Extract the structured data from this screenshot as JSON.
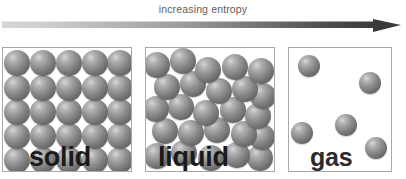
{
  "header": {
    "caption": "increasing entropy",
    "arrow": {
      "name": "gradient-arrow",
      "direction": "right",
      "gradient_start_color": "#cfcfcf",
      "gradient_end_color": "#3a3a3a"
    }
  },
  "colors": {
    "background": "#ffffff",
    "panel_border": "#a8a8a8",
    "caption_text": "#5d5d5d",
    "label_text": "#1a1a1a",
    "sphere_light": "#d8d8d8",
    "sphere_mid": "#8f8f8f",
    "sphere_dark": "#5a5a5a"
  },
  "panels": [
    {
      "id": "solid",
      "label": "solid",
      "particle_count": 25,
      "arrangement": "regular 5x5 close-packed lattice",
      "spheres": [
        {
          "x": 1,
          "y": 2,
          "d": 26
        },
        {
          "x": 27,
          "y": 2,
          "d": 26
        },
        {
          "x": 53,
          "y": 2,
          "d": 26
        },
        {
          "x": 79,
          "y": 2,
          "d": 26
        },
        {
          "x": 104,
          "y": 2,
          "d": 26
        },
        {
          "x": 1,
          "y": 27,
          "d": 26
        },
        {
          "x": 27,
          "y": 27,
          "d": 26
        },
        {
          "x": 53,
          "y": 27,
          "d": 26
        },
        {
          "x": 79,
          "y": 27,
          "d": 26
        },
        {
          "x": 104,
          "y": 27,
          "d": 26
        },
        {
          "x": 1,
          "y": 51,
          "d": 26
        },
        {
          "x": 27,
          "y": 51,
          "d": 26
        },
        {
          "x": 53,
          "y": 51,
          "d": 26
        },
        {
          "x": 79,
          "y": 51,
          "d": 26
        },
        {
          "x": 104,
          "y": 51,
          "d": 26
        },
        {
          "x": 1,
          "y": 75,
          "d": 26
        },
        {
          "x": 27,
          "y": 75,
          "d": 26
        },
        {
          "x": 53,
          "y": 75,
          "d": 26
        },
        {
          "x": 79,
          "y": 75,
          "d": 26
        },
        {
          "x": 104,
          "y": 75,
          "d": 26
        },
        {
          "x": 1,
          "y": 99,
          "d": 26
        },
        {
          "x": 27,
          "y": 99,
          "d": 26
        },
        {
          "x": 53,
          "y": 99,
          "d": 26
        },
        {
          "x": 79,
          "y": 99,
          "d": 26
        },
        {
          "x": 104,
          "y": 99,
          "d": 26
        }
      ]
    },
    {
      "id": "liquid",
      "label": "liquid",
      "particle_count": 24,
      "arrangement": "irregular jittered close packing",
      "spheres": [
        {
          "x": -2,
          "y": 4,
          "d": 26
        },
        {
          "x": 24,
          "y": 0,
          "d": 26
        },
        {
          "x": 49,
          "y": 9,
          "d": 26
        },
        {
          "x": 76,
          "y": 6,
          "d": 26
        },
        {
          "x": 102,
          "y": 10,
          "d": 26
        },
        {
          "x": 8,
          "y": 26,
          "d": 26
        },
        {
          "x": 34,
          "y": 23,
          "d": 26
        },
        {
          "x": 60,
          "y": 30,
          "d": 26
        },
        {
          "x": 86,
          "y": 28,
          "d": 26
        },
        {
          "x": 104,
          "y": 35,
          "d": 26
        },
        {
          "x": -3,
          "y": 48,
          "d": 26
        },
        {
          "x": 22,
          "y": 46,
          "d": 26
        },
        {
          "x": 47,
          "y": 52,
          "d": 26
        },
        {
          "x": 74,
          "y": 49,
          "d": 26
        },
        {
          "x": 99,
          "y": 55,
          "d": 26
        },
        {
          "x": 6,
          "y": 70,
          "d": 26
        },
        {
          "x": 32,
          "y": 72,
          "d": 26
        },
        {
          "x": 58,
          "y": 69,
          "d": 26
        },
        {
          "x": 85,
          "y": 73,
          "d": 26
        },
        {
          "x": 103,
          "y": 76,
          "d": 26
        },
        {
          "x": -2,
          "y": 95,
          "d": 26
        },
        {
          "x": 25,
          "y": 92,
          "d": 26
        },
        {
          "x": 52,
          "y": 97,
          "d": 26
        },
        {
          "x": 78,
          "y": 94,
          "d": 26
        },
        {
          "x": 101,
          "y": 97,
          "d": 26
        }
      ]
    },
    {
      "id": "gas",
      "label": "gas",
      "particle_count": 5,
      "arrangement": "widely separated randomly scattered",
      "spheres": [
        {
          "x": 9,
          "y": 7,
          "d": 22
        },
        {
          "x": 70,
          "y": 24,
          "d": 22
        },
        {
          "x": 2,
          "y": 74,
          "d": 22
        },
        {
          "x": 46,
          "y": 66,
          "d": 22
        },
        {
          "x": 76,
          "y": 89,
          "d": 22
        }
      ]
    }
  ]
}
